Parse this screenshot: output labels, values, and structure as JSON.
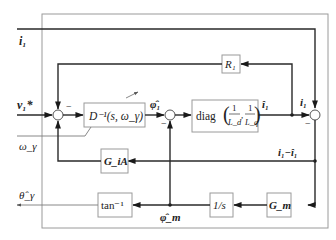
{
  "diagram": {
    "type": "block-diagram",
    "title": "",
    "inputs": {
      "current": "i₁",
      "voltage_command": "v₁*",
      "speed": "ω_γ"
    },
    "output": {
      "angle_estimate": "θ̂_γ"
    },
    "blocks": {
      "r1": {
        "label": "R₁"
      },
      "d_inverse": {
        "label": "D⁻¹(s, ω_γ)"
      },
      "diag": {
        "label_prefix": "diag",
        "frac1_num": "1",
        "frac1_den": "L_d",
        "frac2_num": "1",
        "frac2_den": "L_q"
      },
      "g_ia": {
        "label": "G_iA"
      },
      "g_m": {
        "label": "G_m"
      },
      "integrator": {
        "label": "1/s"
      },
      "atan": {
        "label": "tan⁻¹"
      }
    },
    "signals": {
      "phi1_hat": "φ̂₁",
      "i1_hat": "î₁",
      "i1": "i₁",
      "error": "i₁−î₁",
      "phim_hat": "φ̂_m"
    },
    "signs": {
      "sum1_top": "−",
      "sum2_bottom": "−",
      "sum3_bottom": "−"
    },
    "colors": {
      "wire": "#2a2a2a",
      "frame": "#9a9a9a",
      "background": "#ffffff"
    }
  }
}
